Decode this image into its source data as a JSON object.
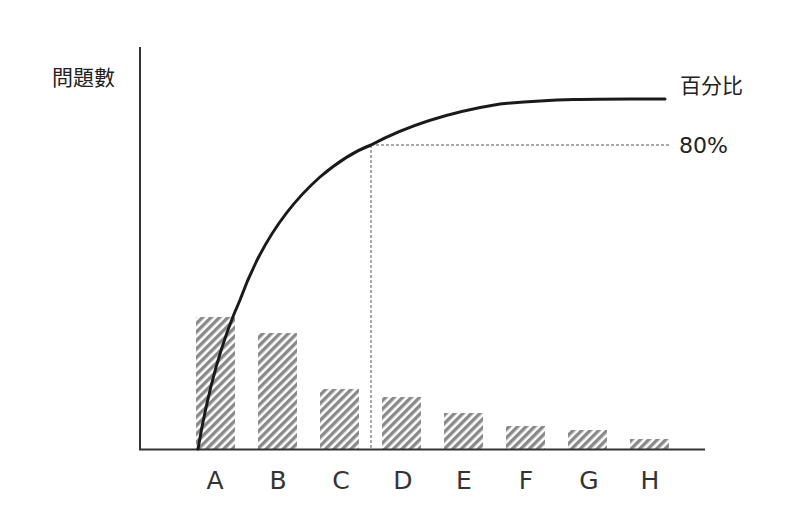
{
  "chart_data": {
    "type": "bar",
    "subtype": "pareto",
    "title": "",
    "xlabel": "",
    "ylabel": "問題數",
    "categories": [
      "A",
      "B",
      "C",
      "D",
      "E",
      "F",
      "G",
      "H"
    ],
    "values": [
      132,
      116,
      60,
      52,
      36,
      23,
      19,
      10
    ],
    "bar_style": "diagonal-hatch",
    "series": [
      {
        "name": "問題數",
        "type": "bar",
        "values": [
          132,
          116,
          60,
          52,
          36,
          23,
          19,
          10
        ]
      },
      {
        "name": "百分比",
        "type": "line",
        "description": "cumulative percentage curve rising from origin and leveling off near top",
        "values_percent": [
          45,
          65,
          80,
          88,
          93,
          96,
          98,
          99
        ]
      }
    ],
    "annotations": [
      {
        "text": "80%",
        "type": "dashed-reference",
        "description": "horizontal dashed line at 80% meeting the curve between C and D, with vertical dashed drop to x-axis"
      }
    ],
    "curve_label": "百分比",
    "grid": false,
    "legend": "none",
    "colors": {
      "bar": "#8a8a8a",
      "curve": "#1a1a1a",
      "axis": "#333333",
      "reference": "#555555"
    }
  },
  "labels": {
    "y_axis": "問題數",
    "curve": "百分比",
    "reference": "80%"
  },
  "geometry": {
    "bars": [
      {
        "x": 196,
        "top": 317
      },
      {
        "x": 258,
        "top": 333
      },
      {
        "x": 320,
        "top": 389
      },
      {
        "x": 382,
        "top": 397
      },
      {
        "x": 444,
        "top": 413
      },
      {
        "x": 506,
        "top": 426
      },
      {
        "x": 568,
        "top": 430
      },
      {
        "x": 630,
        "top": 439
      }
    ]
  }
}
